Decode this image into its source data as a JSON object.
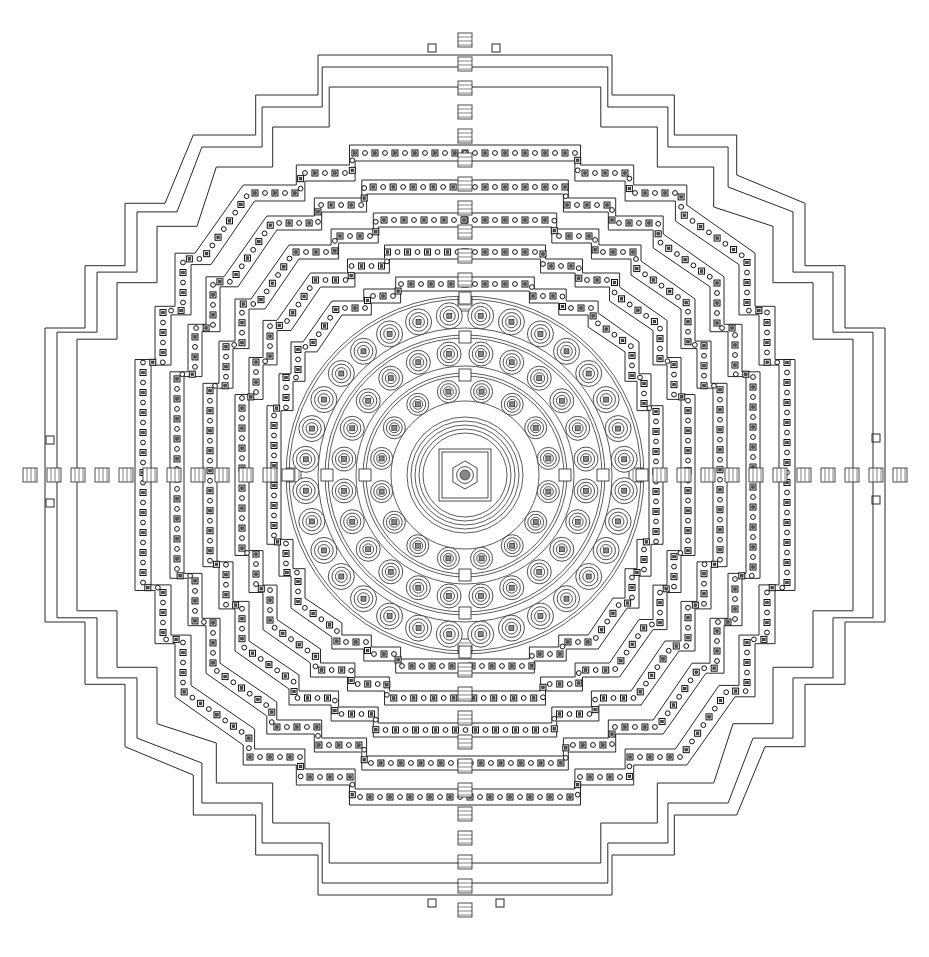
{
  "figure": {
    "type": "architectural-plan",
    "colors": {
      "ink": "#2a2a2a",
      "paper": "#ffffff"
    },
    "center": [
      465,
      475
    ],
    "outer_terraces": [
      {
        "half": 420,
        "steps": [
          0,
          60,
          120
        ],
        "inset": 40
      },
      {
        "half": 408,
        "steps": [
          0,
          60,
          120
        ],
        "inset": 40
      },
      {
        "half": 388,
        "steps": [
          0,
          60,
          120
        ],
        "inset": 40
      }
    ],
    "galleries": [
      {
        "half": 330,
        "steps": [
          0,
          80,
          160
        ],
        "inset": 20,
        "width": 16
      },
      {
        "half": 295,
        "steps": [
          0,
          70,
          140
        ],
        "inset": 18,
        "width": 14
      },
      {
        "half": 262,
        "steps": [
          0,
          60,
          120
        ],
        "inset": 16,
        "width": 14
      },
      {
        "half": 230,
        "steps": [
          0,
          50,
          100
        ],
        "inset": 14,
        "width": 14
      },
      {
        "half": 198,
        "steps": [
          0,
          40,
          80
        ],
        "inset": 12,
        "width": 14
      }
    ],
    "plaza_half": 170,
    "circular_terraces": [
      {
        "r": 160,
        "stupas": 32,
        "stupa_r": 13,
        "ring_r": 147
      },
      {
        "r": 122,
        "stupas": 24,
        "stupa_r": 12,
        "ring_r": 109
      },
      {
        "r": 85,
        "stupas": 16,
        "stupa_r": 11,
        "ring_r": 74
      }
    ],
    "central_rings": [
      58,
      54,
      50,
      46,
      42
    ],
    "central_stupa": {
      "square": 26,
      "hex": 14,
      "core": 5
    },
    "axes": [
      "north",
      "south",
      "east",
      "west"
    ],
    "gate_markers": [
      {
        "x": 432,
        "y": 48
      },
      {
        "x": 496,
        "y": 48
      },
      {
        "x": 432,
        "y": 903
      },
      {
        "x": 500,
        "y": 903
      },
      {
        "x": 50,
        "y": 440
      },
      {
        "x": 50,
        "y": 503
      },
      {
        "x": 876,
        "y": 438
      },
      {
        "x": 876,
        "y": 500
      }
    ]
  }
}
